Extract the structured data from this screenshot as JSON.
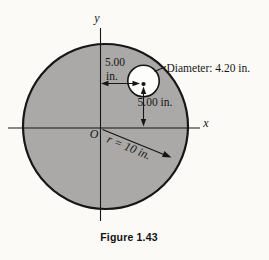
{
  "figure": {
    "caption": "Figure 1.43",
    "diagram": {
      "y_axis_label": "y",
      "x_axis_label": "x",
      "origin_label": "O",
      "radius_label": "r = 10 in.",
      "radius_value_in": 10,
      "diameter_label": "Diameter: 4.20 in.",
      "hole_diameter_in": 4.2,
      "horizontal_offset_line1": "5.00",
      "horizontal_offset_line2": "in.",
      "horizontal_offset_in": 5.0,
      "vertical_offset_label": "5.00 in.",
      "vertical_offset_in": 5.0
    },
    "colors": {
      "background": "#fbfaf6",
      "disk_fill": "#aba9a7",
      "disk_stroke": "#161616",
      "hole_fill": "#fdfdfc",
      "line": "#161616"
    }
  }
}
